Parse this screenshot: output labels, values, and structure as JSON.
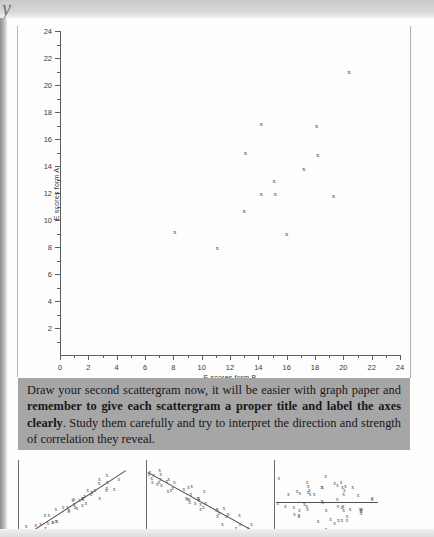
{
  "page": {
    "scan_top_glyph": "y"
  },
  "chart_data": {
    "type": "scatter",
    "title": "",
    "xlabel": "E scores form B",
    "ylabel": "E scores form A",
    "xlim": [
      0,
      24
    ],
    "ylim": [
      0,
      24
    ],
    "xticks": [
      0,
      2,
      4,
      6,
      8,
      10,
      12,
      14,
      16,
      18,
      20,
      22,
      24
    ],
    "yticks": [
      2,
      4,
      6,
      8,
      10,
      12,
      14,
      16,
      18,
      20,
      22,
      24
    ],
    "xtick_labels": [
      "0",
      "2",
      "4",
      "6",
      "8",
      "10",
      "12",
      "14",
      "16",
      "18",
      "20",
      "22",
      "24"
    ],
    "ytick_labels": [
      "2",
      "4",
      "6",
      "8",
      "10",
      "12",
      "14",
      "16",
      "18",
      "20",
      "22",
      "24"
    ],
    "grid": false,
    "legend": false,
    "marker": "x",
    "points": [
      {
        "x": 8.1,
        "y": 9.1
      },
      {
        "x": 11.1,
        "y": 7.9
      },
      {
        "x": 13.0,
        "y": 10.7
      },
      {
        "x": 13.1,
        "y": 15.0
      },
      {
        "x": 14.2,
        "y": 17.1
      },
      {
        "x": 14.2,
        "y": 11.9
      },
      {
        "x": 15.1,
        "y": 12.9
      },
      {
        "x": 15.2,
        "y": 11.9
      },
      {
        "x": 16.0,
        "y": 9.0
      },
      {
        "x": 17.2,
        "y": 13.8
      },
      {
        "x": 18.1,
        "y": 17.0
      },
      {
        "x": 18.2,
        "y": 14.8
      },
      {
        "x": 19.3,
        "y": 11.8
      },
      {
        "x": 20.4,
        "y": 21.0
      }
    ]
  },
  "callout": {
    "segment_1": "Draw your second scattergram now, it will be easier with graph paper and ",
    "segment_bold": "remember to give each scattergram a proper title and label the axes clearly",
    "segment_2": ". Study them carefully and try to interpret the direction and strength of correlation they reveal."
  },
  "mini_plots": [
    {
      "name": "positive-correlation",
      "trend": "rising"
    },
    {
      "name": "negative-correlation",
      "trend": "falling"
    },
    {
      "name": "zero-correlation",
      "trend": "flat"
    }
  ]
}
